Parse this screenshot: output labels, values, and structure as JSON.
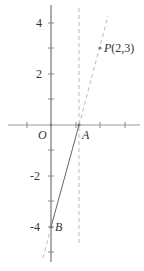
{
  "figure": {
    "origin_label": "O",
    "point_a_label": "A",
    "point_b_label": "B",
    "point_p_label": "P(2,3)",
    "y_tick_labels": {
      "p4": "4",
      "p2": "2",
      "n2": "-2",
      "n4": "-4"
    },
    "colors": {
      "axis": "#999999",
      "solid_line": "#666666",
      "dashed": "#bbbbbb",
      "text": "#333333"
    }
  }
}
